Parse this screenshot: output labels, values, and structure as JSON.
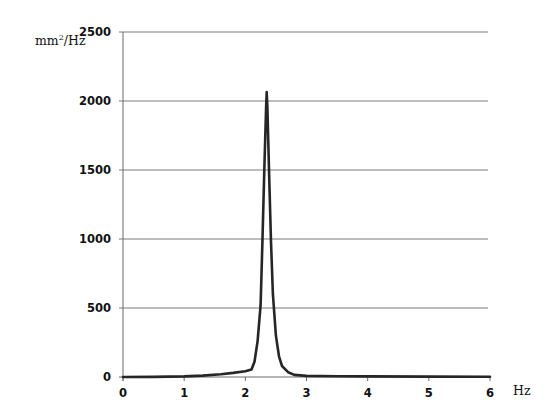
{
  "chart_data": {
    "type": "line",
    "title": "",
    "xlabel": "Hz",
    "ylabel": "mm²/Hz",
    "xlim": [
      0,
      6
    ],
    "ylim": [
      0,
      2500
    ],
    "x_ticks": [
      0,
      1,
      2,
      3,
      4,
      5,
      6
    ],
    "y_ticks": [
      0,
      500,
      1000,
      1500,
      2000,
      2500
    ],
    "grid": {
      "horizontal": true,
      "vertical": false
    },
    "legend": null,
    "series": [
      {
        "name": "PSD",
        "color": "#262626",
        "x": [
          0,
          0.5,
          1.0,
          1.3,
          1.6,
          1.8,
          2.0,
          2.1,
          2.15,
          2.2,
          2.25,
          2.28,
          2.31,
          2.34,
          2.35,
          2.36,
          2.39,
          2.42,
          2.45,
          2.5,
          2.55,
          2.6,
          2.7,
          2.8,
          3.0,
          3.5,
          4.0,
          5.0,
          6.0
        ],
        "y": [
          0,
          1,
          4,
          10,
          20,
          30,
          42,
          55,
          110,
          260,
          520,
          1000,
          1500,
          1950,
          2065,
          1950,
          1450,
          980,
          600,
          300,
          150,
          80,
          35,
          15,
          8,
          5,
          4,
          3,
          2
        ]
      }
    ]
  },
  "labels": {
    "y_unit": "mm",
    "y_unit_sup": "2",
    "y_unit_rest": "/Hz",
    "x_unit": "Hz"
  }
}
